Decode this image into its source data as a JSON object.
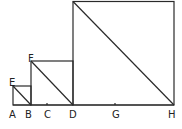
{
  "diagram": {
    "stroke_color": "#2a2a2a",
    "labels": {
      "A": "A",
      "B": "B",
      "C": "C",
      "D": "D",
      "E": "E",
      "F": "F",
      "G": "G",
      "H": "H"
    },
    "squares": [
      {
        "name": "small",
        "corner_label": "E",
        "base": [
          "A",
          "B"
        ]
      },
      {
        "name": "medium",
        "corner_label": "F",
        "base": [
          "B",
          "D"
        ],
        "midpoint_label": "C"
      },
      {
        "name": "large",
        "base": [
          "D",
          "H"
        ],
        "midpoint_label": "G"
      }
    ]
  }
}
